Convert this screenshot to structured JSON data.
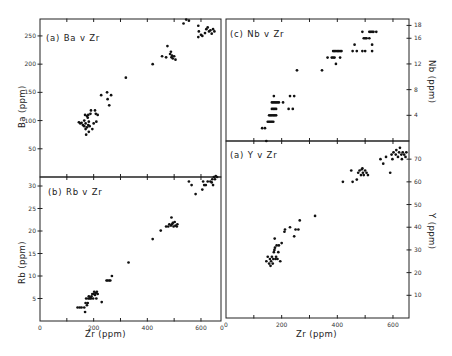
{
  "chart_data": [
    {
      "id": "a_ba",
      "type": "scatter",
      "title": "(a) Ba v Zr",
      "xlabel": "Zr (ppm)",
      "ylabel": "Ba (ppm)",
      "xlim": [
        0,
        675
      ],
      "ylim": [
        0,
        280
      ],
      "yticks": [
        50,
        100,
        150,
        200,
        250
      ],
      "ytick_side": "left",
      "grid": false,
      "points": [
        [
          145,
          97
        ],
        [
          150,
          95
        ],
        [
          155,
          96
        ],
        [
          160,
          92
        ],
        [
          165,
          90
        ],
        [
          165,
          100
        ],
        [
          168,
          110
        ],
        [
          170,
          85
        ],
        [
          170,
          95
        ],
        [
          172,
          75
        ],
        [
          175,
          88
        ],
        [
          175,
          108
        ],
        [
          178,
          105
        ],
        [
          180,
          92
        ],
        [
          180,
          110
        ],
        [
          182,
          98
        ],
        [
          182,
          80
        ],
        [
          185,
          90
        ],
        [
          188,
          112
        ],
        [
          190,
          118
        ],
        [
          195,
          85
        ],
        [
          200,
          95
        ],
        [
          205,
          118
        ],
        [
          208,
          112
        ],
        [
          210,
          98
        ],
        [
          215,
          110
        ],
        [
          228,
          145
        ],
        [
          250,
          150
        ],
        [
          252,
          138
        ],
        [
          258,
          127
        ],
        [
          265,
          145
        ],
        [
          320,
          176
        ],
        [
          420,
          200
        ],
        [
          455,
          214
        ],
        [
          470,
          212
        ],
        [
          475,
          232
        ],
        [
          485,
          218
        ],
        [
          488,
          222
        ],
        [
          490,
          212
        ],
        [
          492,
          215
        ],
        [
          495,
          210
        ],
        [
          500,
          214
        ],
        [
          505,
          208
        ],
        [
          535,
          272
        ],
        [
          545,
          279
        ],
        [
          555,
          277
        ],
        [
          590,
          268
        ],
        [
          590,
          248
        ],
        [
          592,
          258
        ],
        [
          600,
          252
        ],
        [
          605,
          250
        ],
        [
          615,
          255
        ],
        [
          620,
          262
        ],
        [
          625,
          265
        ],
        [
          630,
          258
        ],
        [
          635,
          260
        ],
        [
          640,
          254
        ],
        [
          645,
          262
        ],
        [
          650,
          258
        ]
      ]
    },
    {
      "id": "b_rb",
      "type": "scatter",
      "title": "(b) Rb v Zr",
      "xlabel": "Zr (ppm)",
      "ylabel": "Rb (ppm)",
      "xlim": [
        0,
        675
      ],
      "ylim": [
        0,
        32
      ],
      "xticks": [
        0,
        200,
        400,
        600
      ],
      "yticks": [
        5,
        10,
        15,
        20,
        25,
        30
      ],
      "ytick_side": "left",
      "grid": false,
      "points": [
        [
          140,
          3
        ],
        [
          148,
          3
        ],
        [
          155,
          3
        ],
        [
          165,
          3
        ],
        [
          168,
          2
        ],
        [
          170,
          4
        ],
        [
          172,
          5
        ],
        [
          175,
          3.5
        ],
        [
          178,
          4
        ],
        [
          180,
          5
        ],
        [
          182,
          5.5
        ],
        [
          185,
          5
        ],
        [
          188,
          5.2
        ],
        [
          190,
          5
        ],
        [
          192,
          5.5
        ],
        [
          195,
          6
        ],
        [
          198,
          5
        ],
        [
          200,
          6
        ],
        [
          202,
          6.5
        ],
        [
          205,
          5.8
        ],
        [
          208,
          6.2
        ],
        [
          210,
          5
        ],
        [
          212,
          6.5
        ],
        [
          215,
          6
        ],
        [
          230,
          4.2
        ],
        [
          248,
          9
        ],
        [
          252,
          9
        ],
        [
          258,
          9
        ],
        [
          262,
          9
        ],
        [
          268,
          10
        ],
        [
          330,
          13
        ],
        [
          420,
          18.2
        ],
        [
          450,
          20.1
        ],
        [
          470,
          21
        ],
        [
          478,
          21
        ],
        [
          482,
          21.5
        ],
        [
          488,
          21.2
        ],
        [
          490,
          23
        ],
        [
          492,
          21.5
        ],
        [
          495,
          21.8
        ],
        [
          498,
          21
        ],
        [
          502,
          22
        ],
        [
          505,
          21.2
        ],
        [
          510,
          21
        ],
        [
          512,
          21.5
        ],
        [
          555,
          31
        ],
        [
          565,
          30.2
        ],
        [
          580,
          28.2
        ],
        [
          605,
          29.2
        ],
        [
          608,
          31
        ],
        [
          612,
          30.2
        ],
        [
          618,
          30.2
        ],
        [
          625,
          31
        ],
        [
          635,
          31
        ],
        [
          640,
          30.8
        ],
        [
          642,
          31.5
        ],
        [
          645,
          30.2
        ],
        [
          648,
          32
        ],
        [
          652,
          31.5
        ],
        [
          655,
          32.2
        ],
        [
          660,
          32
        ]
      ]
    },
    {
      "id": "c_nb",
      "type": "scatter",
      "title": "(c) Nb v Zr",
      "xlabel": "Zr (ppm)",
      "ylabel": "Nb (ppm)",
      "xlim": [
        0,
        675
      ],
      "ylim": [
        0,
        19
      ],
      "yticks": [
        4,
        8,
        12,
        16,
        18
      ],
      "ytick_side": "right",
      "grid": false,
      "points": [
        [
          130,
          2
        ],
        [
          140,
          2
        ],
        [
          145,
          0
        ],
        [
          150,
          3
        ],
        [
          155,
          3
        ],
        [
          160,
          3
        ],
        [
          165,
          3
        ],
        [
          170,
          3
        ],
        [
          155,
          4
        ],
        [
          160,
          4
        ],
        [
          165,
          4
        ],
        [
          170,
          4
        ],
        [
          175,
          4
        ],
        [
          180,
          4
        ],
        [
          165,
          5
        ],
        [
          170,
          5
        ],
        [
          175,
          5
        ],
        [
          180,
          5
        ],
        [
          165,
          6
        ],
        [
          170,
          6
        ],
        [
          175,
          6
        ],
        [
          180,
          6
        ],
        [
          185,
          6
        ],
        [
          190,
          6
        ],
        [
          205,
          6
        ],
        [
          172,
          7
        ],
        [
          230,
          7
        ],
        [
          245,
          7
        ],
        [
          225,
          5
        ],
        [
          240,
          5
        ],
        [
          255,
          11
        ],
        [
          345,
          11
        ],
        [
          365,
          13
        ],
        [
          380,
          13
        ],
        [
          385,
          13
        ],
        [
          390,
          13
        ],
        [
          395,
          12
        ],
        [
          410,
          13
        ],
        [
          385,
          14
        ],
        [
          390,
          14
        ],
        [
          395,
          14
        ],
        [
          400,
          14
        ],
        [
          405,
          14
        ],
        [
          410,
          14
        ],
        [
          415,
          14
        ],
        [
          455,
          14
        ],
        [
          462,
          15
        ],
        [
          470,
          14
        ],
        [
          490,
          14
        ],
        [
          500,
          14
        ],
        [
          525,
          14
        ],
        [
          490,
          17
        ],
        [
          495,
          16
        ],
        [
          500,
          16
        ],
        [
          505,
          16
        ],
        [
          515,
          16
        ],
        [
          515,
          17
        ],
        [
          520,
          17
        ],
        [
          525,
          17
        ],
        [
          530,
          17
        ],
        [
          525,
          15
        ],
        [
          540,
          17
        ]
      ]
    },
    {
      "id": "d_y",
      "type": "scatter",
      "title": "(d) Y v Zr",
      "xlabel": "Zr (ppm)",
      "ylabel": "Y (ppm)",
      "xlim": [
        0,
        675
      ],
      "ylim": [
        0,
        78
      ],
      "xticks": [
        0,
        200,
        400,
        600
      ],
      "yticks": [
        10,
        20,
        30,
        40,
        50,
        60,
        70
      ],
      "ytick_side": "right",
      "grid": false,
      "points": [
        [
          145,
          25
        ],
        [
          150,
          27
        ],
        [
          155,
          24
        ],
        [
          158,
          26
        ],
        [
          160,
          23
        ],
        [
          162,
          25
        ],
        [
          165,
          27
        ],
        [
          168,
          24
        ],
        [
          170,
          26
        ],
        [
          172,
          29
        ],
        [
          174,
          30
        ],
        [
          175,
          35
        ],
        [
          176,
          31
        ],
        [
          178,
          26
        ],
        [
          180,
          27
        ],
        [
          182,
          32
        ],
        [
          185,
          26
        ],
        [
          188,
          29
        ],
        [
          190,
          32
        ],
        [
          195,
          25
        ],
        [
          200,
          33
        ],
        [
          210,
          38
        ],
        [
          212,
          39
        ],
        [
          230,
          40
        ],
        [
          245,
          36
        ],
        [
          250,
          39
        ],
        [
          260,
          39
        ],
        [
          265,
          43
        ],
        [
          320,
          45
        ],
        [
          420,
          60
        ],
        [
          450,
          65
        ],
        [
          455,
          60
        ],
        [
          470,
          61
        ],
        [
          475,
          64
        ],
        [
          480,
          65
        ],
        [
          485,
          63
        ],
        [
          488,
          65.5
        ],
        [
          490,
          66
        ],
        [
          492,
          64
        ],
        [
          495,
          63
        ],
        [
          500,
          65
        ],
        [
          505,
          64
        ],
        [
          510,
          63
        ],
        [
          555,
          70
        ],
        [
          565,
          68
        ],
        [
          575,
          71
        ],
        [
          590,
          64
        ],
        [
          595,
          72
        ],
        [
          598,
          70
        ],
        [
          602,
          73
        ],
        [
          610,
          72
        ],
        [
          612,
          74
        ],
        [
          618,
          71
        ],
        [
          622,
          73
        ],
        [
          625,
          75
        ],
        [
          630,
          72
        ],
        [
          632,
          70
        ],
        [
          635,
          73
        ],
        [
          640,
          72
        ],
        [
          645,
          71
        ],
        [
          648,
          73
        ]
      ]
    }
  ],
  "figure": {
    "labels": {
      "a": "(a) Ba v Zr",
      "b": "(b) Rb v Zr",
      "c": "(c) Nb v Zr",
      "d": "(a) Y v Zr",
      "xlabel_left": "Zr (ppm)",
      "xlabel_right": "Zr (ppm)",
      "ylabel_a": "Ba (ppm)",
      "ylabel_b": "Rb (ppm)",
      "ylabel_c": "Nb (ppm)",
      "ylabel_d": "Y (ppm)"
    },
    "xtick_labels": [
      "0",
      "200",
      "400",
      "600"
    ],
    "point_color": "#111111",
    "axis_color": "#222222"
  }
}
